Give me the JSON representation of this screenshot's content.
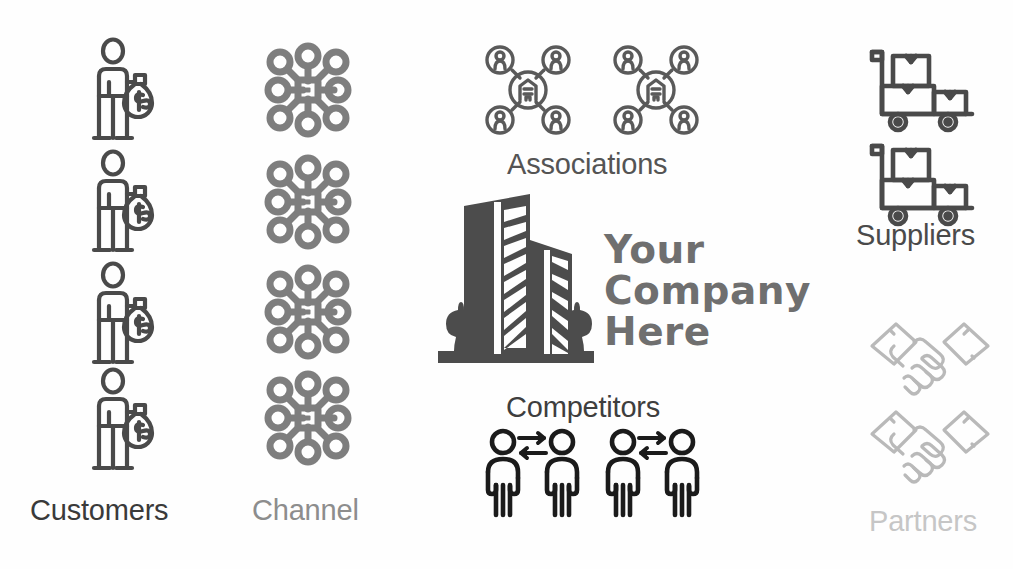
{
  "diagram": {
    "background_color": "#fefefe",
    "center": {
      "wordmark": "Your\nCompany\nHere",
      "wordmark_color": "#6f6f6f",
      "icon_name": "office-building-icon",
      "icon_color": "#4c4c4c"
    },
    "groups": [
      {
        "key": "customers",
        "label": "Customers",
        "label_color": "#3a3a3a",
        "icon_name": "person-with-money-bag-icon",
        "icon_color": "#4a4a4a",
        "count": 4,
        "position": "left-column-1"
      },
      {
        "key": "channel",
        "label": "Channel",
        "label_color": "#8d8d8d",
        "icon_name": "network-hub-icon",
        "icon_color": "#7e7e7e",
        "count": 4,
        "position": "left-column-2"
      },
      {
        "key": "associations",
        "label": "Associations",
        "label_color": "#545454",
        "icon_name": "association-network-icon",
        "icon_color": "#5a5a5a",
        "count": 2,
        "position": "top-center"
      },
      {
        "key": "competitors",
        "label": "Competitors",
        "label_color": "#3e3e3e",
        "icon_name": "two-people-opposing-arrows-icon",
        "icon_color": "#1b1b1b",
        "count": 2,
        "position": "bottom-center"
      },
      {
        "key": "suppliers",
        "label": "Suppliers",
        "label_color": "#4a4a4a",
        "icon_name": "hand-truck-with-boxes-icon",
        "icon_color": "#4a4a4a",
        "count": 2,
        "position": "right-top"
      },
      {
        "key": "partners",
        "label": "Partners",
        "label_color": "#c6c6c6",
        "icon_name": "handshake-icon",
        "icon_color": "#b9b9b9",
        "count": 2,
        "position": "right-bottom"
      }
    ]
  }
}
